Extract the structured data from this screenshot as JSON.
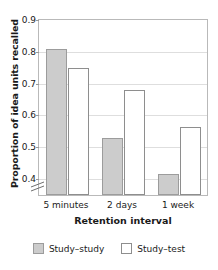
{
  "chart_data": {
    "type": "bar",
    "title": "",
    "xlabel": "Retention interval",
    "ylabel": "Proportion of idea units recalled",
    "categories": [
      "5 minutes",
      "2 days",
      "1 week"
    ],
    "series": [
      {
        "name": "Study–study",
        "values": [
          0.81,
          0.53,
          0.415
        ],
        "color": "#cccccc"
      },
      {
        "name": "Study–test",
        "values": [
          0.75,
          0.68,
          0.565
        ],
        "color": "#ffffff"
      }
    ],
    "ylim": [
      0.35,
      0.9
    ],
    "yticks": [
      "0.4",
      "0.5",
      "0.6",
      "0.7",
      "0.8",
      "0.9"
    ],
    "ytick_values": [
      0.4,
      0.5,
      0.6,
      0.7,
      0.8,
      0.9
    ],
    "grid": true,
    "axis_break": true,
    "legend_position": "bottom"
  },
  "axis": {
    "y_title": "Proportion of idea units recalled",
    "x_title": "Retention interval",
    "tick_0": "0.9",
    "tick_1": "0.8",
    "tick_2": "0.7",
    "tick_3": "0.6",
    "tick_4": "0.5",
    "tick_5": "0.4"
  },
  "xticks": {
    "t0": "5 minutes",
    "t1": "2 days",
    "t2": "1 week"
  },
  "legend": {
    "item_0": "Study–study",
    "item_1": "Study–test"
  }
}
